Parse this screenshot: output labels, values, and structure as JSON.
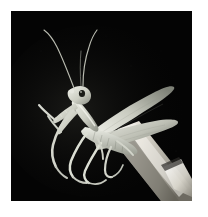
{
  "image": {
    "kind": "photograph",
    "subject": "praying-mantis",
    "scene_description": "A pale green praying mantis perched on a human finger, photographed against a solid black background",
    "frame": {
      "border_color": "#ffffff",
      "background_color": "#040404",
      "left": 11,
      "top": 11,
      "width": 181,
      "height": 190
    },
    "palette": {
      "background": "#040404",
      "body_light": "#e8e9e2",
      "body_mid": "#c3c5ba",
      "body_shadow": "#8e9187",
      "body_dark": "#5d6057",
      "antenna": "#b9bbb0",
      "eye_dark": "#1b1c18",
      "finger_light": "#f2f0ea",
      "finger_mid": "#cfccc2",
      "finger_shadow": "#76736a",
      "nail_highlight": "#ffffff"
    },
    "elements": [
      {
        "name": "black-background",
        "label": "Black studio backdrop"
      },
      {
        "name": "mantis-antenna-left",
        "label": "Left antenna sweeping up and to the left"
      },
      {
        "name": "mantis-antenna-right",
        "label": "Right antenna curving up and to the right"
      },
      {
        "name": "mantis-head",
        "label": "Triangular head with compound eye"
      },
      {
        "name": "mantis-eye",
        "label": "Dark compound eye spot"
      },
      {
        "name": "mantis-foreleg-raptorial-front",
        "label": "Folded raptorial foreleg in praying posture"
      },
      {
        "name": "mantis-foreleg-raptorial-back",
        "label": "Second raptorial foreleg"
      },
      {
        "name": "mantis-thorax",
        "label": "Elongated prothorax"
      },
      {
        "name": "mantis-wing-upper",
        "label": "Upper forewing extending to the right"
      },
      {
        "name": "mantis-wing-lower",
        "label": "Lower forewing extending to the right"
      },
      {
        "name": "mantis-abdomen",
        "label": "Segmented abdomen"
      },
      {
        "name": "mantis-midleg",
        "label": "Middle walking leg"
      },
      {
        "name": "mantis-hindleg",
        "label": "Hind walking leg"
      },
      {
        "name": "human-finger",
        "label": "Human finger the mantis is perched upon"
      },
      {
        "name": "fingernail",
        "label": "Fingernail at the lower right"
      }
    ]
  }
}
